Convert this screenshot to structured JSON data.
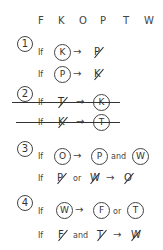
{
  "header": {
    "letters": [
      "F",
      "K",
      "O",
      "P",
      "T",
      "W"
    ]
  },
  "rules": [
    {
      "number": "1",
      "struck": false,
      "lines": [
        {
          "if": "If",
          "premise": "K",
          "arrow": "→",
          "conclusion": "P",
          "conclusion_negated": true
        },
        {
          "if": "If",
          "premise": "P",
          "arrow": "→",
          "conclusion": "K",
          "conclusion_negated": true
        }
      ]
    },
    {
      "number": "2",
      "struck": true,
      "lines": [
        {
          "if": "If",
          "premise": "T",
          "premise_negated": true,
          "arrow": "→",
          "conclusion": "K"
        },
        {
          "if": "If",
          "premise": "K",
          "premise_negated": true,
          "arrow": "→",
          "conclusion": "T"
        }
      ]
    },
    {
      "number": "3",
      "struck": false,
      "lines": [
        {
          "if": "If",
          "premise": "O",
          "arrow": "→",
          "conclusion_a": "P",
          "connector": "and",
          "conclusion_b": "W"
        },
        {
          "if": "If",
          "premise_a": "P",
          "connector": "or",
          "premise_b": "W",
          "premises_negated": true,
          "arrow": "→",
          "conclusion": "O",
          "conclusion_negated": true
        }
      ]
    },
    {
      "number": "4",
      "struck": false,
      "lines": [
        {
          "if": "If",
          "premise": "W",
          "arrow": "→",
          "conclusion_a": "F",
          "connector": "or",
          "conclusion_b": "T"
        },
        {
          "if": "If",
          "premise_a": "F",
          "connector": "and",
          "premise_b": "T",
          "premises_negated": true,
          "arrow": "→",
          "conclusion": "W",
          "conclusion_negated": true
        }
      ]
    }
  ]
}
